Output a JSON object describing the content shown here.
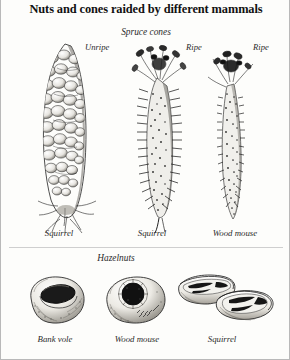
{
  "plate": {
    "title": "Nuts and cones raided by different mammals",
    "background_color": "#fdfdfb",
    "ink_color": "#222222",
    "border_color": "#b9b9b9"
  },
  "sections": [
    {
      "id": "spruce-cones",
      "heading": "Spruce cones",
      "specimens": [
        {
          "id": "cone-unripe-squirrel",
          "ripeness_label": "Unripe",
          "animal_caption": "Squirrel",
          "description": "tall intact unripe spruce cone with bulging scales and fibrous gnawed base"
        },
        {
          "id": "cone-ripe-squirrel",
          "ripeness_label": "Ripe",
          "animal_caption": "Squirrel",
          "description": "ripe cone stripped to a bristly core with a splayed crown of scales left at the tip"
        },
        {
          "id": "cone-ripe-woodmouse",
          "ripeness_label": "Ripe",
          "animal_caption": "Wood mouse",
          "description": "ripe cone gnawed to a narrow tapering core with a tuft of scales left at the tip"
        }
      ]
    },
    {
      "id": "hazelnuts",
      "heading": "Hazelnuts",
      "specimens": [
        {
          "id": "nut-bank-vole",
          "animal_caption": "Bank vole",
          "description": "hazelnut with a wide smooth-edged oval hole gnawed in the side"
        },
        {
          "id": "nut-wood-mouse",
          "animal_caption": "Wood mouse",
          "description": "hazelnut with a round dark hole ringed by toothmarks on the shell surface"
        },
        {
          "id": "nut-squirrel",
          "animal_caption": "Squirrel",
          "description": "hazelnut split cleanly into two overlapping half shells"
        }
      ]
    }
  ]
}
